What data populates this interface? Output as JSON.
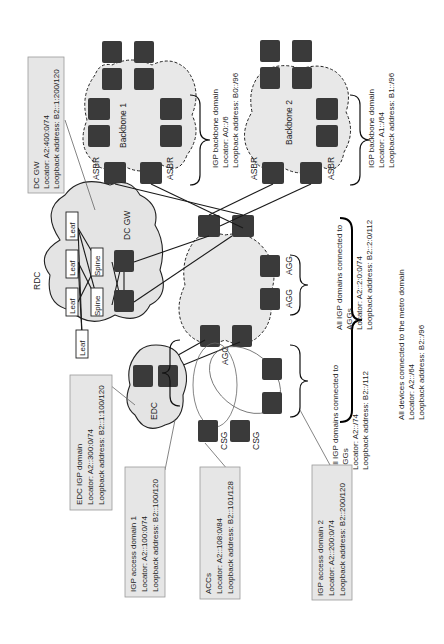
{
  "diagram": {
    "orientation": "rotated 90 degrees counter-clockwise",
    "clouds": {
      "backbone1": "Backbone 1",
      "backbone2": "Backbone 2",
      "rdc": "RDC",
      "edc": "EDC"
    },
    "node_labels": {
      "asbr": "ASBR",
      "agg": "AGG",
      "csg": "CSG",
      "dcgw": "DC GW",
      "leaf": "Leaf",
      "spine": "Spine"
    },
    "callouts": {
      "dcgw": {
        "line1": "DC GW",
        "line2": "Locator: A2:400:0/74",
        "line3": "Loopback address: B2::1:200/120"
      },
      "backbone1_domain": {
        "line1": "IGP backbone domain",
        "line2": "Locator: A0::/6",
        "line3": "Loopback address: B0::/96"
      },
      "backbone2_domain": {
        "line1": "IGP backbone domain",
        "line2": "Locator: A1::/64",
        "line3": "Loopback address: B1::/96"
      },
      "agg_domains_top": {
        "line1": "All IGP domains connected to",
        "line2": "AGGs",
        "line3": "Locator: A2::2:0:0/74",
        "line4": "Loopback address: B2::2:0/112"
      },
      "agg_domains_bottom": {
        "line1": "All IGP domains connected to",
        "line2": "AGGs",
        "line3": "Locator: A2::/74",
        "line4": "Loopback address: B2::/112"
      },
      "metro": {
        "line1": "All devices connected to the metro domain",
        "line2": "Locator: A2::/64",
        "line3": "Loopback address: B2::/96"
      },
      "edc_domain": {
        "line1": "EDC IGP domain",
        "line2": "Locator: A2::300:0/74",
        "line3": "Loopback address: B2::1:100/120"
      },
      "access1": {
        "line1": "IGP access domain 1",
        "line2": "Locator: A2::100:0/74",
        "line3": "Loopback address: B2::100/120"
      },
      "accs": {
        "line1": "ACCs",
        "line2": "Locator: A2::108:0/84",
        "line3": "Loopback address: B2::101/128"
      },
      "access2": {
        "line1": "IGP access domain 2",
        "line2": "Locator: A2::200:0/74",
        "line3": "Loopback address: B2::200/120"
      }
    }
  }
}
